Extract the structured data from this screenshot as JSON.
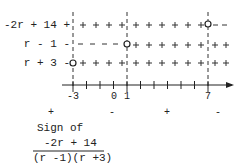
{
  "diagram": {
    "type": "sign-chart",
    "rows": [
      {
        "label": "-2r + 14 +",
        "signs": [
          "+",
          "+",
          "+",
          "+",
          "+",
          "+",
          "+",
          "+",
          "+",
          "+",
          "+",
          "+",
          "+",
          "+",
          "+",
          "+",
          "-",
          "-"
        ],
        "zero_at": 7
      },
      {
        "label": "r - 1 -",
        "signs": [
          "-",
          "-",
          "-",
          "-",
          "-",
          "-",
          "-",
          "-",
          "+",
          "+",
          "+",
          "+",
          "+",
          "+",
          "+",
          "+",
          "+",
          "+"
        ],
        "zero_at": 1
      },
      {
        "label": "r + 3 -",
        "signs": [
          "+",
          "+",
          "+",
          "+",
          "+",
          "+",
          "+",
          "+",
          "+",
          "+",
          "+",
          "+",
          "+",
          "+",
          "+",
          "+",
          "+",
          "+"
        ],
        "zero_at": -3
      }
    ],
    "critical_points": [
      -3,
      1,
      7
    ],
    "axis": {
      "min": -3,
      "max": 7,
      "tick_labels": [
        "-3",
        "0",
        "1",
        "7"
      ]
    },
    "result_signs": [
      "+",
      "-",
      "+",
      "-"
    ],
    "caption": {
      "line1": "Sign of",
      "numerator": "-2r + 14",
      "denominator": "(r -1)(r +3)"
    }
  }
}
